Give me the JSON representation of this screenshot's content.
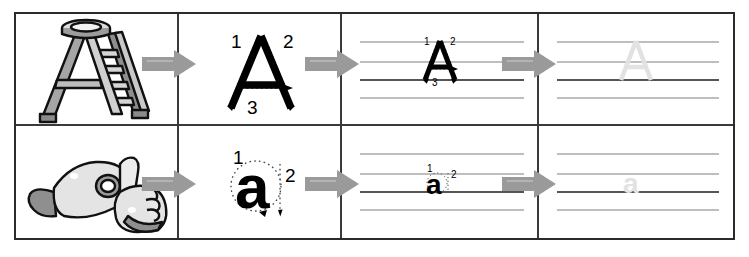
{
  "worksheet": {
    "title": "Letter A handwriting practice worksheet",
    "rows": [
      {
        "id": "row-uppercase",
        "letter": "A",
        "case_label": "uppercase",
        "picture": {
          "name": "step-ladder-illustration",
          "alt": "A-frame step ladder shaped like the letter A"
        },
        "model": {
          "glyph": "A",
          "stroke_numbers": [
            "1",
            "2",
            "3"
          ],
          "stroke_count": 3
        },
        "guided": {
          "glyph": "A",
          "stroke_numbers": [
            "1",
            "2",
            "3"
          ]
        },
        "trace": {
          "glyph": "A",
          "style": "faint-outline"
        }
      },
      {
        "id": "row-lowercase",
        "letter": "a",
        "case_label": "lowercase",
        "picture": {
          "name": "sign-language-hands-illustration",
          "alt": "Two hands, one signing the letter A and one pointing at it"
        },
        "model": {
          "glyph": "a",
          "stroke_numbers": [
            "1",
            "2"
          ],
          "stroke_count": 2
        },
        "guided": {
          "glyph": "a",
          "stroke_numbers": [
            "1",
            "2"
          ]
        },
        "trace": {
          "glyph": "a",
          "style": "faint-outline"
        }
      }
    ],
    "columns": [
      {
        "name": "picture-column",
        "label": "Picture"
      },
      {
        "name": "model-letter-column",
        "label": "Model letter with stroke order"
      },
      {
        "name": "guided-practice-column",
        "label": "Guided practice on ruled lines"
      },
      {
        "name": "trace-practice-column",
        "label": "Trace practice on ruled lines"
      }
    ],
    "arrows": [
      {
        "name": "arrow-picture-to-model",
        "direction": "right"
      },
      {
        "name": "arrow-model-to-guided",
        "direction": "right"
      },
      {
        "name": "arrow-guided-to-trace",
        "direction": "right"
      }
    ],
    "ruled_lines": {
      "count": 4,
      "baseline_index": 3,
      "names": [
        "top-line",
        "midline",
        "baseline",
        "descender-line"
      ]
    },
    "colors": {
      "border": "#2b2b2b",
      "divider": "#3a3a3a",
      "arrow": "#9a9a9a",
      "arrow_highlight": "#b4b4b4",
      "rule_light": "#a9a9a9",
      "rule_baseline": "#555555",
      "letter_ink": "#000000",
      "letter_trace": "#e2e2e2",
      "guide_dots": "#555555",
      "art_outline": "#111111",
      "art_fill_light": "#e8e8e8",
      "art_fill_mid": "#b9b9b9",
      "art_fill_dark": "#7d7d7d"
    }
  }
}
